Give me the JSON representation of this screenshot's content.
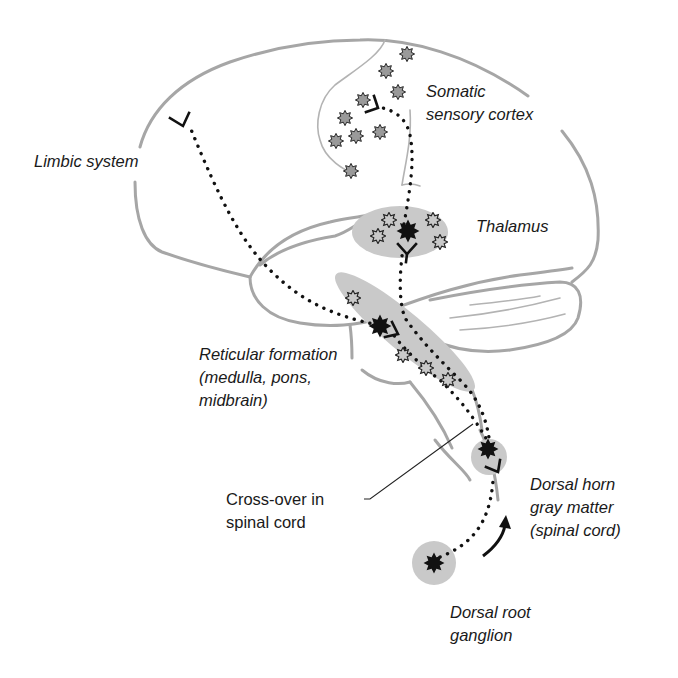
{
  "labels": {
    "somatic_sensory_cortex": {
      "line1": "Somatic",
      "line2": "sensory cortex"
    },
    "limbic_system": {
      "line1": "Limbic system"
    },
    "thalamus": {
      "line1": "Thalamus"
    },
    "reticular_formation": {
      "line1": "Reticular formation",
      "line2": "(medulla, pons,",
      "line3": "midbrain)"
    },
    "cross_over": {
      "line1": "Cross-over in",
      "line2": "spinal cord"
    },
    "dorsal_horn": {
      "line1": "Dorsal horn",
      "line2": "gray matter",
      "line3": "(spinal cord)"
    },
    "dorsal_root_ganglion": {
      "line1": "Dorsal root",
      "line2": "ganglion"
    }
  },
  "colors": {
    "outline": "#a6a6a6",
    "region_fill": "#c9c9c9",
    "neuron_black": "#111111",
    "neuron_gray": "#9a9a9a",
    "text": "#1a1a1a"
  }
}
